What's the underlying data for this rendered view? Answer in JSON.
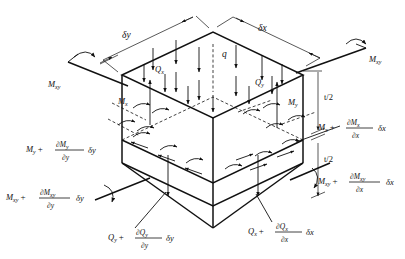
{
  "figure": {
    "background": "#ffffff",
    "ink": "#111111"
  },
  "dimensions": {
    "delta_y": "δy",
    "delta_x": "δx",
    "half_thickness_top": "t/2",
    "half_thickness_bottom": "t/2"
  },
  "load": {
    "distributed": "q"
  },
  "shear_near": {
    "qx": "Q",
    "qx_sub": "x",
    "qy": "Q",
    "qy_sub": "y"
  },
  "moments_near": {
    "mx": "M",
    "mx_sub": "x",
    "my": "M",
    "my_sub": "y",
    "mxy_left": "M",
    "mxy_left_sub": "xy",
    "mxy_right": "M",
    "mxy_right_sub": "xy"
  },
  "moments_far": {
    "my_inc": {
      "base": "M",
      "base_sub": "y",
      "plus": "+",
      "num": "∂M",
      "num_sub": "y",
      "den": "∂y",
      "tail": "δy"
    },
    "mxy_inc_y": {
      "base": "M",
      "base_sub": "xy",
      "plus": "+",
      "num": "∂M",
      "num_sub": "xy",
      "den": "∂y",
      "tail": "δy"
    },
    "mx_inc": {
      "base": "M",
      "base_sub": "x",
      "plus": "+",
      "num": "∂M",
      "num_sub": "x",
      "den": "∂x",
      "tail": "δx"
    },
    "mxy_inc_x": {
      "base": "M",
      "base_sub": "xy",
      "plus": "+",
      "num": "∂M",
      "num_sub": "xy",
      "den": "∂x",
      "tail": "δx"
    }
  },
  "shear_far": {
    "qy_inc": {
      "base": "Q",
      "base_sub": "y",
      "plus": "+",
      "num": "∂Q",
      "num_sub": "y",
      "den": "∂y",
      "tail": "δy"
    },
    "qx_inc": {
      "base": "Q",
      "base_sub": "x",
      "plus": "+",
      "num": "∂Q",
      "num_sub": "x",
      "den": "∂x",
      "tail": "δx"
    }
  }
}
